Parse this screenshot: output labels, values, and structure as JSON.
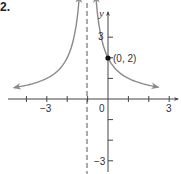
{
  "figure": {
    "number_label": "2."
  },
  "chart_data": {
    "type": "line",
    "title": "",
    "xlabel": "x",
    "ylabel": "y",
    "xlim": [
      -4.5,
      3.4
    ],
    "ylim": [
      -3.4,
      4.2
    ],
    "grid": false,
    "x_tick_labels": [
      {
        "value": -3,
        "label": "−3"
      },
      {
        "value": 0,
        "label": "0"
      },
      {
        "value": 3,
        "label": "3"
      }
    ],
    "y_tick_labels": [
      {
        "value": 3,
        "label": "3"
      },
      {
        "value": -3,
        "label": "−3"
      }
    ],
    "x_ticks": [
      -4,
      -3,
      -2,
      -1,
      1,
      2,
      3
    ],
    "y_ticks": [
      3,
      2,
      1,
      -1,
      -2,
      -3
    ],
    "asymptotes": {
      "vertical": [
        {
          "x": -1,
          "style": "dashed"
        }
      ],
      "horizontal": [
        {
          "y": 0
        }
      ]
    },
    "series": [
      {
        "name": "left branch",
        "x": [
          -4.5,
          -4,
          -3,
          -2,
          -1.5,
          -1.3
        ],
        "y": [
          0.57,
          0.67,
          1.0,
          2.0,
          4.0,
          6.7
        ],
        "arrows": "both"
      },
      {
        "name": "right branch",
        "x": [
          -0.7,
          -0.5,
          0,
          1,
          2,
          2.5
        ],
        "y": [
          6.7,
          4.0,
          2.0,
          1.0,
          0.67,
          0.57
        ],
        "arrows": "both"
      }
    ],
    "annotations": [
      {
        "x": 0,
        "y": 2,
        "label": "(0, 2)",
        "marker": "filled-circle"
      }
    ],
    "colors": {
      "curve": "#8a8a8a",
      "axes": "#444444",
      "asymptote": "#555555",
      "point": "#111111"
    }
  }
}
